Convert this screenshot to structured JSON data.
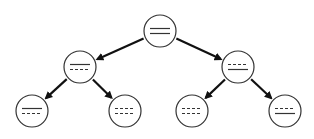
{
  "diagram": {
    "type": "binary-tree",
    "background": "#ffffff",
    "stroke_color": "#333333",
    "arrow_color": "#111111",
    "node_radius": 16,
    "nodes": [
      {
        "id": "root",
        "cx": 160,
        "cy": 31,
        "lines": [
          "solid",
          "solid"
        ]
      },
      {
        "id": "left",
        "cx": 80,
        "cy": 67,
        "lines": [
          "solid",
          "dashed"
        ]
      },
      {
        "id": "right",
        "cx": 238,
        "cy": 67,
        "lines": [
          "dashed",
          "solid"
        ]
      },
      {
        "id": "left-left",
        "cx": 32,
        "cy": 111,
        "lines": [
          "solid",
          "dashed"
        ]
      },
      {
        "id": "left-right",
        "cx": 125,
        "cy": 111,
        "lines": [
          "dashed",
          "dashed"
        ]
      },
      {
        "id": "right-left",
        "cx": 192,
        "cy": 111,
        "lines": [
          "dashed",
          "dashed"
        ]
      },
      {
        "id": "right-right",
        "cx": 285,
        "cy": 111,
        "lines": [
          "dashed",
          "solid"
        ]
      }
    ],
    "edges": [
      {
        "from": "root",
        "to": "left"
      },
      {
        "from": "root",
        "to": "right"
      },
      {
        "from": "left",
        "to": "left-left"
      },
      {
        "from": "left",
        "to": "left-right"
      },
      {
        "from": "right",
        "to": "right-left"
      },
      {
        "from": "right",
        "to": "right-right"
      }
    ]
  }
}
